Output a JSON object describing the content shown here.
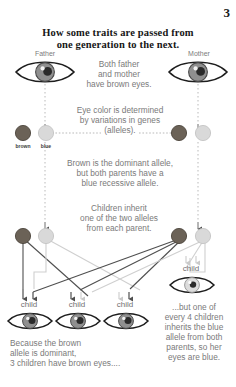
{
  "page": {
    "number": "3"
  },
  "title": {
    "line1": "How some traits are passed from",
    "line2": "one generation to the next."
  },
  "parents": [
    {
      "label": "Father",
      "eye_color": "brown",
      "side": "left"
    },
    {
      "label": "Mother",
      "eye_color": "brown",
      "side": "right"
    }
  ],
  "captions": {
    "parents_eyes": {
      "line1": "Both father",
      "line2": "and mother",
      "line3": "have brown eyes."
    },
    "alleles": {
      "line1": "Eye color is determined",
      "line2": "by variations in genes",
      "line3": "(alleles)."
    },
    "dominance": {
      "line1": "Brown is the dominant allele,",
      "line2": "but both parents have a",
      "line3": "blue recessive allele."
    },
    "inheritance": {
      "line1": "Children inherit",
      "line2": "one of the two alleles",
      "line3": "from each parent."
    },
    "brown_result": {
      "line1": "Because the brown",
      "line2": "allele is dominant,",
      "line3": "3 children have brown eyes...."
    },
    "blue_result": {
      "line1": "...but one of",
      "line2": "every 4 children",
      "line3": "inherits the blue",
      "line4": "allele from both",
      "line5": "parents, so her",
      "line6": "eyes are blue."
    }
  },
  "allele_labels": {
    "brown": "brown",
    "blue": "blue"
  },
  "allele_rows": [
    {
      "row": "explanation",
      "father": [
        {
          "type": "brown",
          "labeled": true
        },
        {
          "type": "blue",
          "labeled": true
        }
      ],
      "mother": [
        {
          "type": "brown",
          "labeled": false
        },
        {
          "type": "blue",
          "labeled": false
        }
      ]
    },
    {
      "row": "inheritance",
      "father": [
        {
          "type": "brown",
          "labeled": false
        },
        {
          "type": "blue",
          "labeled": false
        }
      ],
      "mother": [
        {
          "type": "brown",
          "labeled": false
        },
        {
          "type": "blue",
          "labeled": false
        }
      ]
    }
  ],
  "children": [
    {
      "label": "child",
      "eye_color": "brown",
      "inherited": [
        "brown",
        "brown"
      ]
    },
    {
      "label": "child",
      "eye_color": "brown",
      "inherited": [
        "brown",
        "blue"
      ]
    },
    {
      "label": "child",
      "eye_color": "brown",
      "inherited": [
        "blue",
        "brown"
      ]
    },
    {
      "label": "child",
      "eye_color": "blue",
      "inherited": [
        "blue",
        "blue"
      ]
    }
  ],
  "colors": {
    "brown_allele": "#6b6257",
    "blue_allele": "#d6d6d6",
    "brown_iris": "#8a8a8a",
    "blue_iris": "#d0d0d0",
    "text": "#7a7a7a",
    "title": "#161616",
    "line_dark": "#4f4f4f",
    "line_light": "#cfcfcf",
    "dotted": "#b9b9b9"
  }
}
